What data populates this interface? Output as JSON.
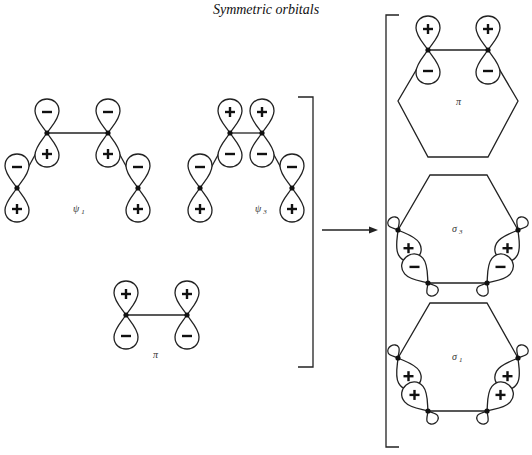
{
  "title": "Symmetric orbitals",
  "left_group": {
    "psi1": {
      "label": "ψ",
      "subscript": "1",
      "atoms": [
        {
          "x": 17,
          "y": 188,
          "up": "-",
          "down": "+"
        },
        {
          "x": 47,
          "y": 133,
          "up": "-",
          "down": "+"
        },
        {
          "x": 108,
          "y": 133,
          "up": "-",
          "down": "+"
        },
        {
          "x": 138,
          "y": 188,
          "up": "-",
          "down": "+"
        }
      ]
    },
    "psi3": {
      "label": "ψ",
      "subscript": "3",
      "atoms": [
        {
          "x": 200,
          "y": 188,
          "up": "-",
          "down": "+"
        },
        {
          "x": 230,
          "y": 133,
          "up": "+",
          "down": "-"
        },
        {
          "x": 262,
          "y": 133,
          "up": "+",
          "down": "-"
        },
        {
          "x": 292,
          "y": 188,
          "up": "-",
          "down": "+"
        }
      ]
    },
    "pi": {
      "label": "π",
      "atoms": [
        {
          "x": 126,
          "y": 315,
          "up": "+",
          "down": "-"
        },
        {
          "x": 187,
          "y": 315,
          "up": "+",
          "down": "-"
        }
      ]
    }
  },
  "right_group": {
    "pi": {
      "label": "π",
      "lobes_top": [
        "+",
        "+"
      ],
      "lobes_bottom": [
        "-",
        "-"
      ]
    },
    "sigma3": {
      "label": "σ",
      "subscript": "3",
      "lobes_outer": [
        "+",
        "+"
      ],
      "lobes_inner": [
        "-",
        "-"
      ]
    },
    "sigma1": {
      "label": "σ",
      "subscript": "1",
      "lobes_outer": [
        "+",
        "+"
      ],
      "lobes_inner": [
        "+",
        "+"
      ]
    }
  },
  "arrow": {
    "direction": "right"
  }
}
